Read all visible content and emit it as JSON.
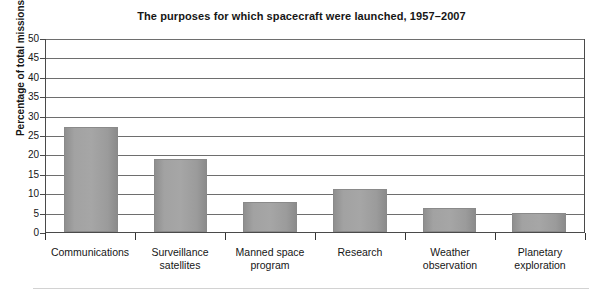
{
  "chart_data": {
    "type": "bar",
    "title": "The purposes for which spacecraft were launched, 1957–2007",
    "xlabel": "",
    "ylabel": "Percentage of total missions",
    "ylim": [
      0,
      50
    ],
    "ytick_step": 5,
    "yticks": [
      "50",
      "45",
      "40",
      "35",
      "30",
      "25",
      "20",
      "15",
      "10",
      "5",
      "0"
    ],
    "grid": true,
    "legend": null,
    "categories": [
      "Communications",
      "Surveillance satellites",
      "Manned space program",
      "Research",
      "Weather observation",
      "Planetary exploration"
    ],
    "category_lines": [
      [
        "Communications"
      ],
      [
        "Surveillance",
        "satellites"
      ],
      [
        "Manned space",
        "program"
      ],
      [
        "Research"
      ],
      [
        "Weather",
        "observation"
      ],
      [
        "Planetary",
        "exploration"
      ]
    ],
    "values": [
      27,
      18.7,
      7.8,
      11,
      6.2,
      5
    ],
    "bar_color": "#a2a2a2",
    "axis_color": "#4a4a4a",
    "grid_color": "#6e6e6e",
    "text_color": "#161616"
  }
}
